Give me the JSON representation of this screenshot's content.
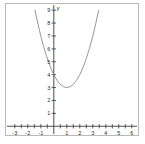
{
  "figure": {
    "name": "parabola-graph",
    "background": "#ffffff",
    "border_color": "#b9b9b9",
    "axis_color": "#3a3a3a",
    "curve_color": "#8c8c8c"
  },
  "axis_labels": {
    "y": "y",
    "x": ""
  },
  "chart_data": {
    "type": "line",
    "title": "",
    "xlabel": "",
    "ylabel": "y",
    "xlim": [
      -3.6,
      6.4
    ],
    "ylim": [
      -0.6,
      9.4
    ],
    "grid": false,
    "legend": null,
    "xticks": [
      -3,
      -2,
      -1,
      1,
      2,
      3,
      4,
      5,
      6
    ],
    "xtick_labels": [
      "-3",
      "-2",
      "-1",
      "1",
      "2",
      "3",
      "4",
      "5",
      "6"
    ],
    "yticks": [
      1,
      2,
      3,
      4,
      5,
      6,
      7,
      8,
      9
    ],
    "ytick_labels": [
      "1",
      "2",
      "3",
      "4",
      "5",
      "6",
      "7",
      "8",
      "9"
    ],
    "minor_xticks": [
      -2.5,
      -1.5,
      -0.5,
      0.5,
      1.5,
      2.5,
      3.5,
      4.5,
      5.5
    ],
    "series": [
      {
        "name": "y = x^2 - 2x + 4",
        "equation": "y = x^2 - 2x + 4",
        "vertex": [
          1,
          3
        ],
        "y_intercept": [
          0,
          4
        ],
        "x": [
          -1.45,
          -1.2,
          -1.0,
          -0.8,
          -0.6,
          -0.4,
          -0.2,
          0.0,
          0.25,
          0.5,
          0.75,
          1.0,
          1.25,
          1.5,
          1.75,
          2.0,
          2.25,
          2.5,
          2.75,
          3.0,
          3.25,
          3.45
        ],
        "values": [
          9.0,
          7.84,
          7.0,
          6.24,
          5.56,
          4.96,
          4.44,
          4.0,
          3.5625,
          3.25,
          3.0625,
          3.0,
          3.0625,
          3.25,
          3.5625,
          4.0,
          4.5625,
          5.25,
          6.0625,
          7.0,
          8.0625,
          9.0
        ]
      }
    ]
  }
}
